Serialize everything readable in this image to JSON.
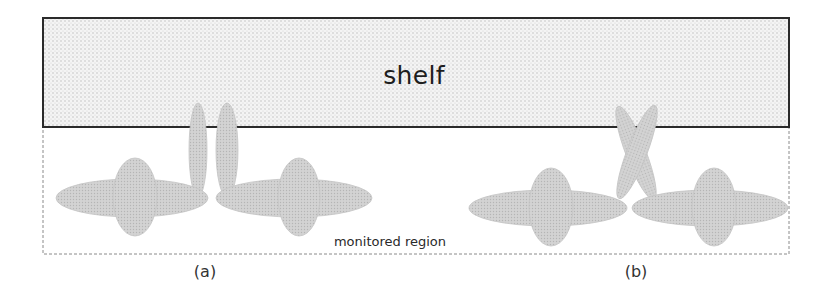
{
  "diagram": {
    "shelf": {
      "label": "shelf",
      "x": 43,
      "y": 18,
      "width": 746,
      "height": 109,
      "fill": "#f4f4f4",
      "dot_color": "#b9b9b9",
      "stroke": "#2b2b2b",
      "label_pos": [
        414,
        75
      ]
    },
    "monitored_region": {
      "label": "monitored region",
      "x": 43,
      "y": 127,
      "width": 746,
      "height": 127,
      "stroke": "#8a8a8a",
      "label_pos": [
        390,
        241
      ]
    },
    "person_style": {
      "fill": "#d3d3d3",
      "dot_color": "#b5b5b5",
      "stroke": "#c4c4c4"
    },
    "panels": [
      {
        "id": "a",
        "label": "(a)",
        "label_pos": [
          205,
          271
        ],
        "persons": [
          {
            "body": {
              "cx": 132,
              "cy": 198,
              "rx": 76,
              "ry": 19
            },
            "head": {
              "cx": 135,
              "cy": 197,
              "rx": 22,
              "ry": 39
            }
          },
          {
            "body": {
              "cx": 294,
              "cy": 198,
              "rx": 78,
              "ry": 19
            },
            "head": {
              "cx": 299,
              "cy": 197,
              "rx": 21,
              "ry": 39
            }
          }
        ],
        "arms": [
          {
            "cx": 198,
            "cy": 150,
            "rx": 9,
            "ry": 47,
            "rotate": 0
          },
          {
            "cx": 227,
            "cy": 150,
            "rx": 11,
            "ry": 47,
            "rotate": 0
          }
        ]
      },
      {
        "id": "b",
        "label": "(b)",
        "label_pos": [
          636,
          271
        ],
        "persons": [
          {
            "body": {
              "cx": 548,
              "cy": 208,
              "rx": 79,
              "ry": 18
            },
            "head": {
              "cx": 551,
              "cy": 207,
              "rx": 22,
              "ry": 39
            }
          },
          {
            "body": {
              "cx": 710,
              "cy": 208,
              "rx": 78,
              "ry": 18
            },
            "head": {
              "cx": 714,
              "cy": 207,
              "rx": 22,
              "ry": 39
            }
          }
        ],
        "arms": [
          {
            "cx": 636,
            "cy": 153,
            "rx": 10,
            "ry": 50,
            "rotate": -21
          },
          {
            "cx": 637,
            "cy": 152,
            "rx": 10,
            "ry": 50,
            "rotate": 21
          }
        ]
      }
    ]
  }
}
